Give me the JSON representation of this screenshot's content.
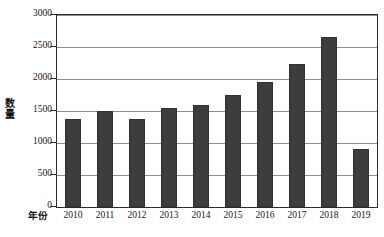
{
  "chart_data": {
    "type": "bar",
    "title": "",
    "xlabel": "年份",
    "ylabel": "数量",
    "categories": [
      "2010",
      "2011",
      "2012",
      "2013",
      "2014",
      "2015",
      "2016",
      "2017",
      "2018",
      "2019"
    ],
    "values": [
      1380,
      1500,
      1375,
      1550,
      1590,
      1750,
      1960,
      2230,
      2650,
      900
    ],
    "series": [
      {
        "name": "数量",
        "values": [
          1380,
          1500,
          1375,
          1550,
          1590,
          1750,
          1960,
          2230,
          2650,
          900
        ]
      }
    ],
    "ylim": [
      0,
      3000
    ],
    "yticks": [
      0,
      500,
      1000,
      1500,
      2000,
      2500,
      3000
    ],
    "ytick_labels": [
      "0",
      "500",
      "1000",
      "1500",
      "2000",
      "2500",
      "3000"
    ],
    "grid": true,
    "legend": "none",
    "bar_color": "#3d3d3d",
    "gridline_color": "#8e8e8e",
    "axis_color": "#2b2b2b",
    "background_color": "#ffffff"
  }
}
